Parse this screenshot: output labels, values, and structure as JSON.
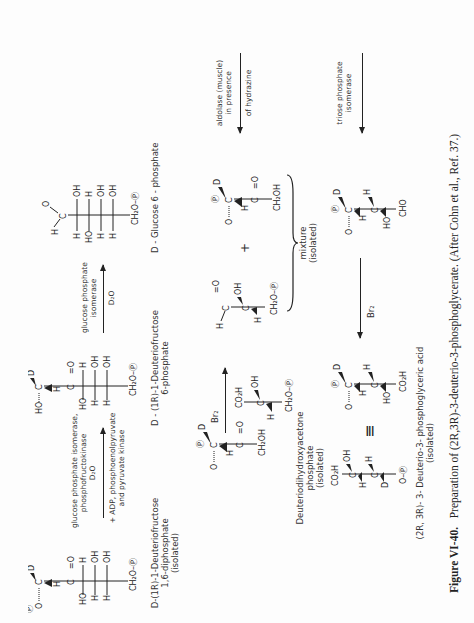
{
  "figure": {
    "number": "Figure VI-40.",
    "caption": "Preparation of (2R,3R)-3-deuterio-3-phosphoglycerate. (After Cohn et al., Ref. 37.)"
  },
  "compounds": {
    "glucose6p": {
      "name": "D - Glucose 6 - phosphate"
    },
    "fructose6p": {
      "name_line1": "D - (1R)-1-Deuteriofructose",
      "name_line2": "6-phosphate"
    },
    "fructose16p": {
      "name_line1": "D-(1R)-1-Deuteriofructose",
      "name_line2": "1,6-diphosphate",
      "name_line3": "(isolated)"
    },
    "dhap": {
      "name_line1": "Deuteriodihydroxyacetone",
      "name_line2": "phosphate",
      "name_line3": "(isolated)"
    },
    "mixture": {
      "line1": "mixture",
      "line2": "(isolated)"
    },
    "product": {
      "name_line1": "(2R, 3R)- 3- Deuterio-3- phosphoglyceric acid",
      "name_line2": "(isolated)"
    }
  },
  "arrows": {
    "isomerase": {
      "above": "glucose phosphate",
      "above2": "isomerase",
      "below": "D₂O"
    },
    "pfk": {
      "above": "glucose phosphate isomerase,",
      "above2": "phosphofructokinase",
      "mid": "D₂O",
      "below": "+ ADP, phosphoenolpyruvate",
      "below2": "and pyruvate kinase"
    },
    "aldolase": {
      "above": "aldolase (muscle)",
      "above2": "in presence",
      "below": "of hydrazine"
    },
    "tpi": {
      "above": "triose phosphate",
      "above2": "isomerase"
    },
    "br2_top": {
      "label": "Br₂"
    },
    "br2_bottom": {
      "label": "Br₂"
    }
  },
  "symbols": {
    "plus": "+",
    "equiv": "≡",
    "phosphate": "P"
  }
}
